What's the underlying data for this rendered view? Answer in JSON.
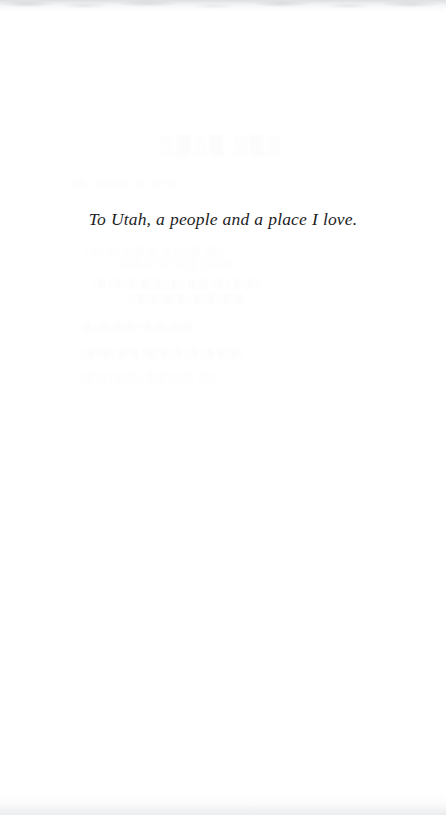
{
  "page": {
    "kind": "book-dedication-page",
    "background_color": "#ffffff",
    "text_color": "#1d1d1f",
    "ghost_color": "#dfe1e4"
  },
  "dedication": {
    "text": "To Utah, a people and a place I love."
  },
  "ghost_text": {
    "note": "Faint show-through of type printed on the reverse of the leaf; illegible in the scan.",
    "title_line": "░▒░▒  ░▒░",
    "lines": [
      {
        "text": "░▒░   ▒░▒░▒   ░▒   ░▒░▒░",
        "top": 178,
        "left": 72,
        "size": 9,
        "class": "ghost-fainter"
      },
      {
        "text": "░▒░▒░  ▒░▒░▒░▒  ░▒░▒   ░▒░",
        "top": 246,
        "left": 86,
        "size": 9,
        "class": "ghost-fainter"
      },
      {
        "text": "▒░▒░▒░▒ ░▒░▒  ░▒░▒░",
        "top": 258,
        "left": 120,
        "size": 9,
        "class": "ghost-fainter"
      },
      {
        "text": "░▒ ░▒░▒░▒░▒░ ▒░ ▒░▒   ░▒░  ▒░▒░",
        "top": 278,
        "left": 92,
        "size": 9,
        "class": "ghost-faint"
      },
      {
        "text": "░ ▒░▒░▒░▒░ ▒░▒        ░▒░▒",
        "top": 293,
        "left": 128,
        "size": 9,
        "class": "ghost-faint"
      },
      {
        "text": "░▒  ░▒░▒░▒░ ▒░▒░▒░▒",
        "top": 322,
        "left": 78,
        "size": 9,
        "class": "ghost-faint"
      },
      {
        "text": "░▒░▒░ ▒░▒ ░▒░▒░▒ ░▒    ░▒    ▒░▒░",
        "top": 348,
        "left": 82,
        "size": 9,
        "class": "ghost-faint"
      },
      {
        "text": "░▒░▒ ░▒░▒░ ▒░▒░▒░▒ ░▒░",
        "top": 372,
        "left": 80,
        "size": 9,
        "class": "ghost-fainter"
      }
    ]
  }
}
